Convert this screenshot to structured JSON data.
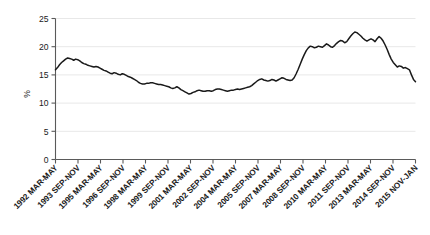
{
  "chart_data": {
    "type": "line",
    "title": "",
    "subtitle": "",
    "xlabel": "",
    "ylabel": "%",
    "ylim": [
      0,
      25
    ],
    "yticks": [
      0,
      5,
      10,
      15,
      20,
      25
    ],
    "ytick_labels": [
      "0",
      "5",
      "10",
      "15",
      "20",
      "25"
    ],
    "grid": true,
    "grid_axis": "y",
    "legend": false,
    "legend_position": "none",
    "line_color": "#1a1a1a",
    "grid_color": "#e8e8e8",
    "axis_color": "#5a5a5a",
    "background_color": "#ffffff",
    "xtick_labels": [
      "1992 MAR-MAY",
      "1993 SEP-NOV",
      "1995 MAR-MAY",
      "1996 SEP-NOV",
      "1998 MAR-MAY",
      "1999 SEP-NOV",
      "2001 MAR-MAY",
      "2002 SEP-NOV",
      "2004 MAR-MAY",
      "2005 SEP-NOV",
      "2007 MAR-MAY",
      "2008 SEP-NOV",
      "2010 MAR-MAY",
      "2011 SEP-NOV",
      "2013 MAR-MAY",
      "2014 SEP-NOV",
      "2015 NOV-JAN"
    ],
    "xtick_rotation": 45,
    "x_period_start": "1992 MAR-MAY",
    "x_period_end": "2015 NOV-JAN",
    "series": [
      {
        "name": "%",
        "values": [
          15.9,
          16.3,
          16.8,
          17.2,
          17.5,
          17.8,
          18.0,
          17.9,
          17.8,
          17.6,
          17.8,
          17.7,
          17.5,
          17.2,
          17.0,
          16.9,
          16.7,
          16.6,
          16.5,
          16.4,
          16.5,
          16.4,
          16.2,
          16.0,
          15.8,
          15.7,
          15.5,
          15.3,
          15.2,
          15.4,
          15.3,
          15.1,
          15.0,
          15.2,
          15.1,
          14.9,
          14.7,
          14.6,
          14.4,
          14.2,
          14.0,
          13.7,
          13.5,
          13.4,
          13.4,
          13.5,
          13.5,
          13.6,
          13.6,
          13.5,
          13.4,
          13.3,
          13.3,
          13.2,
          13.1,
          13.0,
          12.9,
          12.7,
          12.6,
          12.7,
          12.9,
          12.7,
          12.4,
          12.2,
          12.0,
          11.8,
          11.6,
          11.7,
          11.9,
          12.0,
          12.2,
          12.3,
          12.2,
          12.1,
          12.1,
          12.2,
          12.2,
          12.1,
          12.2,
          12.4,
          12.5,
          12.5,
          12.4,
          12.3,
          12.2,
          12.1,
          12.2,
          12.3,
          12.3,
          12.4,
          12.5,
          12.4,
          12.5,
          12.6,
          12.7,
          12.8,
          12.9,
          13.1,
          13.4,
          13.7,
          14.0,
          14.2,
          14.3,
          14.1,
          14.0,
          13.9,
          14.0,
          14.2,
          14.1,
          13.9,
          14.1,
          14.3,
          14.5,
          14.4,
          14.2,
          14.1,
          14.0,
          14.1,
          14.5,
          15.2,
          16.0,
          16.9,
          17.8,
          18.6,
          19.3,
          19.8,
          20.1,
          20.0,
          19.8,
          19.9,
          20.1,
          20.0,
          19.9,
          20.2,
          20.5,
          20.3,
          20.0,
          19.9,
          20.2,
          20.6,
          20.9,
          21.1,
          21.0,
          20.7,
          20.9,
          21.4,
          21.9,
          22.3,
          22.6,
          22.5,
          22.2,
          21.9,
          21.5,
          21.2,
          21.0,
          21.2,
          21.4,
          21.2,
          20.9,
          21.4,
          21.8,
          21.5,
          21.0,
          20.3,
          19.5,
          18.6,
          17.8,
          17.2,
          16.8,
          16.4,
          16.6,
          16.5,
          16.2,
          16.3,
          16.1,
          15.9,
          15.0,
          14.2,
          13.8
        ]
      }
    ]
  }
}
